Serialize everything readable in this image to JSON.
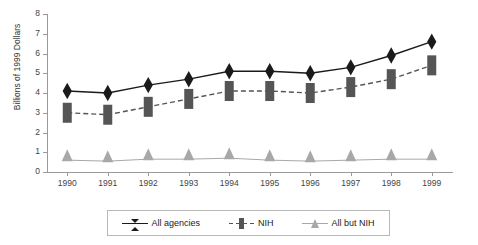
{
  "chart_data": {
    "type": "line",
    "title": "",
    "xlabel": "",
    "ylabel": "Billions of 1999 Dollars",
    "categories": [
      "1990",
      "1991",
      "1992",
      "1993",
      "1994",
      "1995",
      "1996",
      "1997",
      "1998",
      "1999"
    ],
    "ylim": [
      0,
      8
    ],
    "ytick_labels": [
      "0",
      "1",
      "2",
      "3",
      "4",
      "5",
      "6",
      "7",
      "8"
    ],
    "ytick_values": [
      0,
      1,
      2,
      3,
      4,
      5,
      6,
      7,
      8
    ],
    "grid": false,
    "legend_position": "bottom",
    "series": [
      {
        "name": "All agencies",
        "marker": "diamond",
        "color": "#1a1a1a",
        "line_style": "solid",
        "values": [
          4.1,
          4.0,
          4.4,
          4.7,
          5.1,
          5.1,
          5.0,
          5.3,
          5.9,
          6.6
        ]
      },
      {
        "name": "NIH",
        "marker": "square",
        "color": "#555555",
        "line_style": "dashed",
        "values": [
          3.0,
          2.9,
          3.3,
          3.7,
          4.1,
          4.1,
          4.0,
          4.3,
          4.7,
          5.4
        ]
      },
      {
        "name": "All but NIH",
        "marker": "triangle",
        "color": "#a8a8a8",
        "line_style": "solid",
        "values": [
          0.6,
          0.55,
          0.65,
          0.65,
          0.7,
          0.6,
          0.55,
          0.6,
          0.65,
          0.65
        ]
      }
    ]
  },
  "legend": {
    "items": [
      {
        "label": "All agencies"
      },
      {
        "label": "NIH"
      },
      {
        "label": "All but NIH"
      }
    ]
  },
  "axes": {
    "y_title": "Billions of 1999 Dollars"
  }
}
